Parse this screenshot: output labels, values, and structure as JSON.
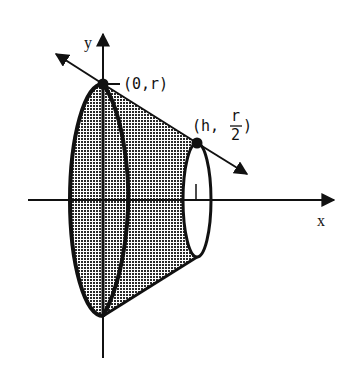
{
  "diagram": {
    "type": "frustum-of-revolution",
    "axes": {
      "x_label": "x",
      "y_label": "y"
    },
    "points": [
      {
        "id": "p1",
        "label": "(0,r)",
        "coords": [
          "0",
          "r"
        ]
      },
      {
        "id": "p2",
        "label_prefix": "(h,",
        "fraction_num": "r",
        "fraction_den": "2",
        "label_suffix": ")",
        "coords": [
          "h",
          "r/2"
        ]
      }
    ],
    "colors": {
      "stroke": "#111111",
      "fill_pattern": "#2a2a2a",
      "background": "#ffffff"
    }
  }
}
